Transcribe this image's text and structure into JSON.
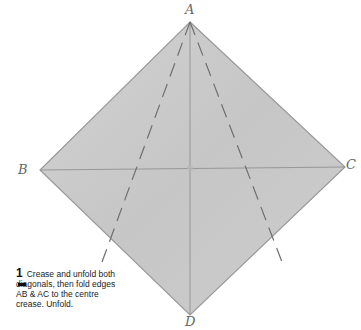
{
  "diagram": {
    "points": {
      "A": {
        "label": "A",
        "x": 190,
        "y": 22
      },
      "B": {
        "label": "B",
        "x": 40,
        "y": 170
      },
      "C": {
        "label": "C",
        "x": 345,
        "y": 167
      },
      "D": {
        "label": "D",
        "x": 190,
        "y": 315
      }
    },
    "center": {
      "x": 190,
      "y": 168
    },
    "paper_color": "#c9c9c9",
    "edge_color": "#9a9a9a",
    "crease_color": "#8a8a8a",
    "dashed_color": "#6f6f6f"
  },
  "step": {
    "number": "1",
    "text": "Crease and unfold both diagonals, then fold edges AB & AC to the centre crease. Unfold."
  }
}
